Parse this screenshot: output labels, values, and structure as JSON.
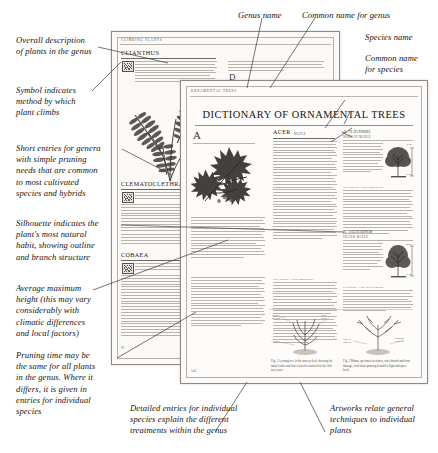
{
  "figure": {
    "type": "annotated-book-spread"
  },
  "annotations": {
    "left": [
      {
        "id": "overall-description",
        "text": "Overall description\nof plants in the genus"
      },
      {
        "id": "symbol-climb-method",
        "text": "Symbol indicates\nmethod by which\nplant climbs"
      },
      {
        "id": "short-entries",
        "text": "Short entries for genera\nwith simple pruning\nneeds that are common\nto most cultivated\nspecies and hybrids"
      },
      {
        "id": "silhouette",
        "text": "Silhouette indicates the\nplant's most natural\nhabit, showing outline\nand branch structure"
      },
      {
        "id": "average-height",
        "text": "Average maximum\nheight (this may vary\nconsiderably with\nclimatic differences\nand local factors)"
      },
      {
        "id": "pruning-time",
        "text": "Pruning time may be\nthe same for all plants\nin the genus. Where it\ndiffers, it is given in\nentries for individual\nspecies"
      }
    ],
    "top": [
      {
        "id": "genus-name",
        "text": "Genus name"
      },
      {
        "id": "common-name-genus",
        "text": "Common name for genus"
      }
    ],
    "right": [
      {
        "id": "species-name",
        "text": "Species name"
      },
      {
        "id": "common-name-species",
        "text": "Common name\nfor species"
      }
    ],
    "bottom": [
      {
        "id": "detailed-entries",
        "text": "Detailed entries for individual\nspecies explain the different\ntreatments within the genus"
      },
      {
        "id": "artworks",
        "text": "Artworks relate general\ntechniques to individual\nplants"
      }
    ]
  },
  "book": {
    "left_page": {
      "running_head": "CLIMBING PLANTS",
      "genera": [
        {
          "name": "CLIANTHUS",
          "common": "Glory pea, Parrot's bill"
        },
        {
          "name": "CLEMATOCLETHRA",
          "common": ""
        },
        {
          "name": "COBAEA",
          "common": "Cup-and-saucer vine"
        }
      ],
      "right_column_genera": [
        {
          "name": "D",
          "label": ""
        },
        {
          "name": "DECUMARIA",
          "common": "Wood vamp"
        }
      ],
      "folio": "91"
    },
    "right_page": {
      "running_head": "ORNAMENTAL TREES",
      "title": "DICTIONARY OF ORNAMENTAL TREES",
      "genus": {
        "name": "ACER",
        "common": "MAPLE"
      },
      "species": [
        {
          "name": "A. platanoides",
          "common": "NORWAY MAPLE",
          "height": "15 m",
          "spread": "10 m"
        },
        {
          "name": "A. saccharinum",
          "common": "SILVER MAPLE",
          "height": "20 m",
          "spread": "12 m"
        }
      ],
      "subheads": [
        "TRAINING AND PRUNING",
        "FEEDING AND WATERING"
      ],
      "artwork_captions": [
        "Fig. 1  A young tree in the nursery bed, showing the main leader and lower laterals retained for the first two years.",
        "Fig. 2  Mature specimen in winter, after branch and frost damage, with basic pruning to build a light and open head."
      ],
      "artwork_labels": [
        "Remove crossing branch",
        "Main leader",
        "Cut back",
        "Suckers removed at base",
        "Damaged wood cut back to healthy growth"
      ],
      "folio": "145"
    },
    "footer_rule": true
  },
  "colors": {
    "ink": "#16120f",
    "paper": "#fbfaf7",
    "paper_front": "#fdfcfa",
    "border": "#8e8a83",
    "leader": "#3d3933"
  }
}
